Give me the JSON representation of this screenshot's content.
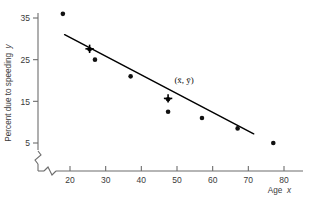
{
  "chart_data": {
    "type": "scatter",
    "title": "",
    "subtitle": "",
    "xlabel": "Age  x",
    "ylabel": "Percent due to speeding  y",
    "xlim": [
      15,
      83
    ],
    "ylim": [
      0,
      39
    ],
    "xticks": [
      20,
      30,
      40,
      50,
      60,
      70,
      80
    ],
    "yticks": [
      5,
      15,
      25,
      35
    ],
    "grid": false,
    "legend": null,
    "axis_breaks": {
      "x": true,
      "y": true
    },
    "points": [
      {
        "x": 18,
        "y": 36.0
      },
      {
        "x": 25.5,
        "y": 27.5
      },
      {
        "x": 27,
        "y": 25.0
      },
      {
        "x": 37,
        "y": 21.0
      },
      {
        "x": 47.5,
        "y": 15.5
      },
      {
        "x": 47.5,
        "y": 12.5
      },
      {
        "x": 57,
        "y": 11.0
      },
      {
        "x": 67,
        "y": 8.5
      },
      {
        "x": 77,
        "y": 5.0
      }
    ],
    "regression_line": {
      "x_start": 18.5,
      "y_start": 31.0,
      "x_end": 71.5,
      "y_end": 7.2
    },
    "markers": [
      {
        "label": "",
        "x": 25.5,
        "y": 27.6,
        "style": "plus"
      },
      {
        "label": "(x̄, ȳ)",
        "x": 47.5,
        "y": 15.7,
        "style": "plus"
      }
    ],
    "annotations": [
      {
        "text": "(x̄, ȳ)",
        "x": 52,
        "y": 19.5
      }
    ]
  },
  "axes": {
    "x_title": "Age",
    "x_var": "x",
    "y_title": "Percent due to speeding",
    "y_var": "y"
  },
  "colors": {
    "axis": "#6d6d6d",
    "point": "#111111",
    "line": "#000000",
    "text": "#3a3a3a",
    "background": "#ffffff"
  }
}
